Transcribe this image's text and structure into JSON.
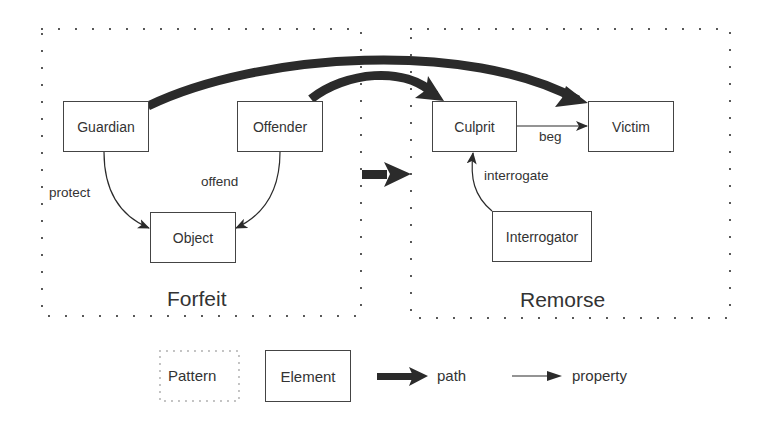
{
  "diagram": {
    "patterns": [
      {
        "id": "forfeit",
        "title": "Forfeit"
      },
      {
        "id": "remorse",
        "title": "Remorse"
      }
    ],
    "elements": {
      "guardian": "Guardian",
      "offender": "Offender",
      "object": "Object",
      "culprit": "Culprit",
      "victim": "Victim",
      "interrogator": "Interrogator"
    },
    "properties": {
      "protect": "protect",
      "offend": "offend",
      "beg": "beg",
      "interrogate": "interrogate"
    },
    "edges": [
      {
        "from": "Guardian",
        "to": "Object",
        "label": "protect",
        "type": "property"
      },
      {
        "from": "Offender",
        "to": "Object",
        "label": "offend",
        "type": "property"
      },
      {
        "from": "Culprit",
        "to": "Victim",
        "label": "beg",
        "type": "property"
      },
      {
        "from": "Interrogator",
        "to": "Culprit",
        "label": "interrogate",
        "type": "property"
      },
      {
        "from": "Guardian",
        "to": "Victim",
        "label": "",
        "type": "path"
      },
      {
        "from": "Offender",
        "to": "Culprit",
        "label": "",
        "type": "path"
      },
      {
        "from": "Forfeit",
        "to": "Remorse",
        "label": "",
        "type": "path"
      }
    ]
  },
  "legend": {
    "pattern": "Pattern",
    "element": "Element",
    "path": "path",
    "property": "property"
  },
  "colors": {
    "stroke": "#2b2b2b",
    "text": "#333333",
    "background": "#ffffff"
  }
}
